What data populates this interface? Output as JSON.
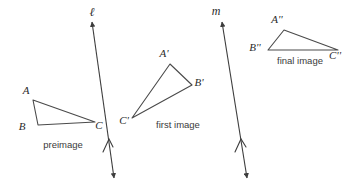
{
  "figure": {
    "background_color": "#ffffff",
    "stroke_color": "#4a4a4a"
  },
  "triangles": [
    {
      "id": "preimage",
      "caption": "preimage",
      "caption_x": 63,
      "caption_y": 148,
      "vertices": [
        {
          "label": "A",
          "x": 33,
          "y": 100,
          "label_x": 26,
          "label_y": 94
        },
        {
          "label": "B",
          "x": 38,
          "y": 125,
          "label_x": 22,
          "label_y": 130
        },
        {
          "label": "C",
          "x": 95,
          "y": 122,
          "label_x": 99,
          "label_y": 129
        }
      ]
    },
    {
      "id": "first-image",
      "caption": "first image",
      "caption_x": 178,
      "caption_y": 128,
      "vertices": [
        {
          "label": "A'",
          "x": 170,
          "y": 64,
          "label_x": 164,
          "label_y": 57
        },
        {
          "label": "B'",
          "x": 192,
          "y": 85,
          "label_x": 197,
          "label_y": 86
        },
        {
          "label": "C'",
          "x": 132,
          "y": 118,
          "label_x": 122,
          "label_y": 123
        }
      ]
    },
    {
      "id": "final-image",
      "caption": "final image",
      "caption_x": 300,
      "caption_y": 64,
      "vertices": [
        {
          "label": "A''",
          "x": 284,
          "y": 30,
          "label_x": 276,
          "label_y": 23
        },
        {
          "label": "B''",
          "x": 268,
          "y": 50,
          "label_x": 253,
          "label_y": 50
        },
        {
          "label": "C''",
          "x": 338,
          "y": 50,
          "label_x": 331,
          "label_y": 59
        }
      ]
    }
  ],
  "lines": [
    {
      "id": "line-l",
      "label": "ℓ",
      "label_x": 92,
      "label_y": 16,
      "x1": 92,
      "y1": 22,
      "x2": 114,
      "y2": 178,
      "tick_x": 108,
      "tick_y": 142
    },
    {
      "id": "line-m",
      "label": "m",
      "label_x": 216,
      "label_y": 15,
      "x1": 222,
      "y1": 22,
      "x2": 247,
      "y2": 178,
      "tick_x": 240,
      "tick_y": 142
    }
  ]
}
